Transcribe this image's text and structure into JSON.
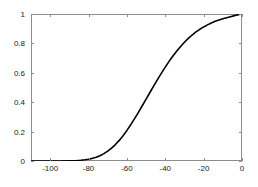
{
  "chart_data": {
    "type": "line",
    "title": "",
    "xlabel": "",
    "ylabel": "",
    "xlim": [
      -110,
      0
    ],
    "ylim": [
      0,
      1
    ],
    "grid": false,
    "legend": null,
    "xticks": [
      -100,
      -80,
      -60,
      -40,
      -20,
      0
    ],
    "xtick_labels": [
      "-100",
      "-80",
      "-60",
      "-40",
      "-20",
      "0"
    ],
    "yticks": [
      0,
      0.2,
      0.4,
      0.6,
      0.8,
      1
    ],
    "ytick_labels": [
      "0",
      "0.2",
      "0.4",
      "0.6",
      "0.8",
      "1"
    ],
    "line_color": "#000000",
    "line_width": 1.6,
    "axis_color": "#8d8d8d",
    "background": "#ffffff",
    "series": [
      {
        "name": "cdf",
        "x": [
          -110,
          -105,
          -100,
          -95,
          -90,
          -88,
          -86,
          -84,
          -82,
          -80,
          -78,
          -76,
          -74,
          -72,
          -70,
          -68,
          -66,
          -64,
          -62,
          -60,
          -58,
          -56,
          -54,
          -52,
          -50,
          -48,
          -46,
          -44,
          -42,
          -40,
          -38,
          -36,
          -34,
          -32,
          -30,
          -28,
          -26,
          -24,
          -22,
          -20,
          -18,
          -16,
          -14,
          -12,
          -10,
          -8,
          -6,
          -4,
          -2,
          0
        ],
        "y": [
          0.0,
          0.0,
          0.0,
          0.0,
          0.001,
          0.002,
          0.003,
          0.005,
          0.008,
          0.012,
          0.018,
          0.026,
          0.036,
          0.05,
          0.067,
          0.088,
          0.112,
          0.14,
          0.172,
          0.208,
          0.247,
          0.288,
          0.331,
          0.376,
          0.421,
          0.466,
          0.511,
          0.555,
          0.598,
          0.639,
          0.678,
          0.714,
          0.748,
          0.779,
          0.808,
          0.834,
          0.857,
          0.878,
          0.896,
          0.912,
          0.926,
          0.939,
          0.95,
          0.959,
          0.967,
          0.975,
          0.982,
          0.989,
          0.995,
          1.0
        ]
      }
    ]
  }
}
